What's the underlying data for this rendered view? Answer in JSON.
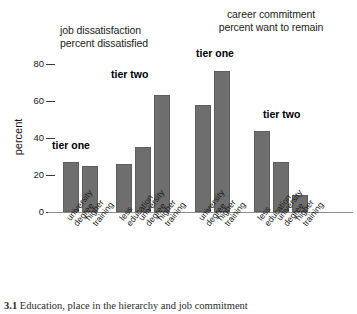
{
  "chart_data": {
    "type": "bar",
    "title": "",
    "xlabel": "",
    "ylabel": "percent",
    "ylim": [
      0,
      85
    ],
    "yticks": [
      0,
      20,
      40,
      60,
      80
    ],
    "grid": false,
    "legend": "none",
    "panels": [
      {
        "name": "job dissatisfaction",
        "title_line1": "job dissatisfaction",
        "title_line2": "percent dissatisfied",
        "groups": [
          {
            "tier": "tier one",
            "categories": [
              "university degree",
              "higher training"
            ],
            "values": [
              27,
              25
            ]
          },
          {
            "tier": "tier two",
            "categories": [
              "less education",
              "university degree",
              "higher training"
            ],
            "values": [
              26,
              35,
              63
            ]
          }
        ]
      },
      {
        "name": "career commitment",
        "title_line1": "career commitment",
        "title_line2": "percent want to remain",
        "groups": [
          {
            "tier": "tier one",
            "categories": [
              "university degree",
              "higher training"
            ],
            "values": [
              58,
              76
            ]
          },
          {
            "tier": "tier two",
            "categories": [
              "less education",
              "university degree",
              "higher training"
            ],
            "values": [
              44,
              27,
              9
            ]
          }
        ]
      }
    ],
    "bar_color": "#6e6e6e",
    "axis_color": "#8d8d8d"
  },
  "axis": {
    "y_label": "percent",
    "ticks": [
      "80",
      "60",
      "40",
      "20",
      "0"
    ]
  },
  "titles": {
    "left_line1": "job dissatisfaction",
    "left_line2": "percent dissatisfied",
    "right_line1": "career commitment",
    "right_line2": "percent want to remain"
  },
  "annotations": {
    "left_tier_one": "tier one",
    "left_tier_two": "tier two",
    "right_tier_one": "tier one",
    "right_tier_two": "tier two"
  },
  "xlabels": {
    "g1b1_w1": "university",
    "g1b1_w2": "degree",
    "g1b2_w1": "higher",
    "g1b2_w2": "training",
    "g2b1_w1": "less",
    "g2b1_w2": "education",
    "g2b2_w1": "university",
    "g2b2_w2": "degree",
    "g2b3_w1": "higher",
    "g2b3_w2": "training",
    "g3b1_w1": "university",
    "g3b1_w2": "degree",
    "g3b2_w1": "higher",
    "g3b2_w2": "training",
    "g4b1_w1": "less",
    "g4b1_w2": "education",
    "g4b2_w1": "university",
    "g4b2_w2": "degree",
    "g4b3_w1": "higher",
    "g4b3_w2": "training"
  },
  "caption": {
    "number": "3.1",
    "text": "Education, place in the hierarchy and job commitment"
  }
}
